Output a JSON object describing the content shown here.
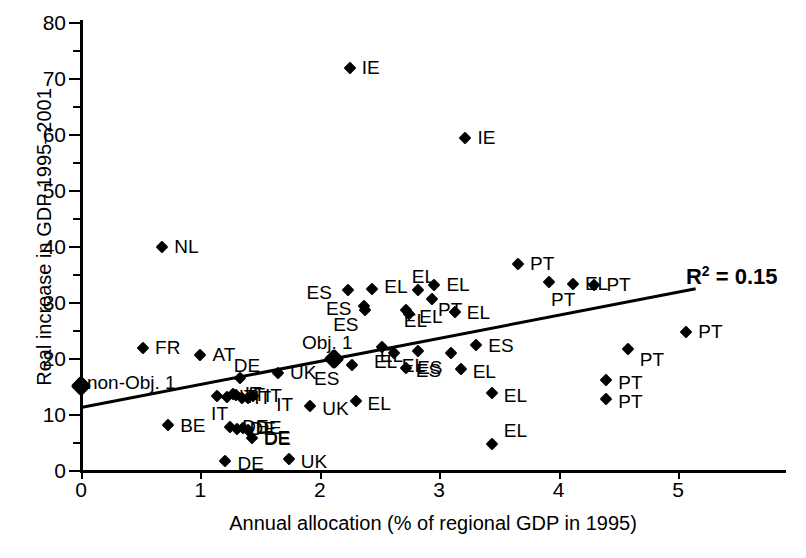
{
  "chart_data": {
    "type": "scatter",
    "title": "",
    "xlabel": "Annual allocation (% of regional GDP in 1995)",
    "ylabel": "Real increase in GDP 1995–2001",
    "xlim": [
      0,
      5.9
    ],
    "ylim": [
      0,
      80
    ],
    "xticks": [
      "0",
      "1",
      "2",
      "3",
      "4",
      "5"
    ],
    "yticks": [
      "0",
      "10",
      "20",
      "30",
      "40",
      "50",
      "60",
      "70",
      "80"
    ],
    "y_minor_ticks": [
      5,
      15,
      25,
      35,
      45,
      55,
      65,
      75
    ],
    "grid": false,
    "legend": "none",
    "annotations": [
      {
        "name": "r_squared",
        "text": "R² = 0.15",
        "value": 0.15,
        "x": 5.15,
        "y": 35.5
      },
      {
        "name": "non-obj-1-label",
        "text": "non-Obj. 1",
        "x": 0.05,
        "y": 15.5
      },
      {
        "name": "obj-1-label",
        "text": "Obj. 1",
        "x": 1.85,
        "y": 22.6
      }
    ],
    "trendline": {
      "x0": 0.0,
      "y0": 11.4,
      "x1": 5.15,
      "y1": 32.6
    },
    "special_markers": [
      {
        "label": "non-Obj. 1",
        "x": 0.0,
        "y": 15.0,
        "size": "big"
      },
      {
        "label": "Obj. 1",
        "x": 2.12,
        "y": 19.9,
        "size": "big"
      }
    ],
    "points": [
      {
        "label": "IE",
        "x": 2.25,
        "y": 71.8
      },
      {
        "label": "IE",
        "x": 3.22,
        "y": 59.3
      },
      {
        "label": "NL",
        "x": 0.68,
        "y": 39.8
      },
      {
        "label": "PT",
        "x": 3.66,
        "y": 36.8
      },
      {
        "label": "PT",
        "x": 3.92,
        "y": 33.5
      },
      {
        "label": "EL",
        "x": 4.12,
        "y": 33.3
      },
      {
        "label": "EL",
        "x": 2.96,
        "y": 33.1
      },
      {
        "label": "PT",
        "x": 4.3,
        "y": 33.0
      },
      {
        "label": "ES",
        "x": 2.24,
        "y": 32.2
      },
      {
        "label": "EL",
        "x": 2.44,
        "y": 32.3
      },
      {
        "label": "EL",
        "x": 2.82,
        "y": 32.2
      },
      {
        "label": "ES",
        "x": 2.37,
        "y": 29.3
      },
      {
        "label": "ES",
        "x": 2.38,
        "y": 28.6
      },
      {
        "label": "PT",
        "x": 2.94,
        "y": 30.5
      },
      {
        "label": "EL",
        "x": 2.72,
        "y": 28.6
      },
      {
        "label": "EL",
        "x": 2.75,
        "y": 27.8
      },
      {
        "label": "EL",
        "x": 3.13,
        "y": 28.3
      },
      {
        "label": "PT",
        "x": 5.07,
        "y": 24.6
      },
      {
        "label": "PT",
        "x": 4.58,
        "y": 21.6
      },
      {
        "label": "FR",
        "x": 0.52,
        "y": 21.7
      },
      {
        "label": "AT",
        "x": 1.0,
        "y": 20.5
      },
      {
        "label": "EL",
        "x": 2.52,
        "y": 22.0
      },
      {
        "label": "ES",
        "x": 3.31,
        "y": 22.3
      },
      {
        "label": "EL",
        "x": 2.62,
        "y": 20.9
      },
      {
        "label": "EL",
        "x": 2.82,
        "y": 21.2
      },
      {
        "label": "ES",
        "x": 3.1,
        "y": 20.9
      },
      {
        "label": "ES",
        "x": 2.27,
        "y": 18.8
      },
      {
        "label": "ES",
        "x": 2.72,
        "y": 18.2
      },
      {
        "label": "EL",
        "x": 3.18,
        "y": 18.1
      },
      {
        "label": "UK",
        "x": 1.65,
        "y": 17.3
      },
      {
        "label": "DE",
        "x": 1.33,
        "y": 16.5
      },
      {
        "label": "PT",
        "x": 4.4,
        "y": 16.0
      },
      {
        "label": "EL",
        "x": 3.44,
        "y": 13.7
      },
      {
        "label": "PT",
        "x": 4.4,
        "y": 12.6
      },
      {
        "label": "UK",
        "x": 1.92,
        "y": 11.5
      },
      {
        "label": "EL",
        "x": 2.3,
        "y": 12.4
      },
      {
        "label": "IT",
        "x": 1.14,
        "y": 13.2
      },
      {
        "label": "IT",
        "x": 1.22,
        "y": 13.0
      },
      {
        "label": "IT",
        "x": 1.27,
        "y": 13.6
      },
      {
        "label": "IT",
        "x": 1.3,
        "y": 13.4
      },
      {
        "label": "IT",
        "x": 1.35,
        "y": 12.8
      },
      {
        "label": "IT",
        "x": 1.4,
        "y": 12.9
      },
      {
        "label": "IT",
        "x": 1.44,
        "y": 13.2
      },
      {
        "label": "BE",
        "x": 0.73,
        "y": 8.1
      },
      {
        "label": "DE",
        "x": 1.25,
        "y": 7.6
      },
      {
        "label": "DE",
        "x": 1.31,
        "y": 7.3
      },
      {
        "label": "DE",
        "x": 1.36,
        "y": 7.5
      },
      {
        "label": "DE",
        "x": 1.4,
        "y": 7.2
      },
      {
        "label": "DE",
        "x": 1.43,
        "y": 5.7
      },
      {
        "label": "DE",
        "x": 1.21,
        "y": 1.6
      },
      {
        "label": "UK",
        "x": 1.74,
        "y": 1.9
      },
      {
        "label": "EL",
        "x": 3.44,
        "y": 4.6
      }
    ],
    "label_offsets": [
      {
        "i": 0,
        "dx": 12,
        "dy": -1
      },
      {
        "i": 1,
        "dx": 12,
        "dy": -1
      },
      {
        "i": 2,
        "dx": 12,
        "dy": -1
      },
      {
        "i": 3,
        "dx": 12,
        "dy": -1
      },
      {
        "i": 4,
        "dx": 2,
        "dy": 17
      },
      {
        "i": 5,
        "dx": 12,
        "dy": -1
      },
      {
        "i": 6,
        "dx": 12,
        "dy": -1
      },
      {
        "i": 7,
        "dx": 12,
        "dy": -1
      },
      {
        "i": 8,
        "dx": -42,
        "dy": 2
      },
      {
        "i": 9,
        "dx": 12,
        "dy": -3
      },
      {
        "i": 10,
        "dx": -6,
        "dy": -14
      },
      {
        "i": 11,
        "dx": -38,
        "dy": 2
      },
      {
        "i": 12,
        "dx": -32,
        "dy": 14
      },
      {
        "i": 13,
        "dx": 6,
        "dy": 10
      },
      {
        "i": 14,
        "dx": -2,
        "dy": 10
      },
      {
        "i": 15,
        "dx": 10,
        "dy": 2
      },
      {
        "i": 16,
        "dx": 12,
        "dy": 0
      },
      {
        "i": 17,
        "dx": 12,
        "dy": -1
      },
      {
        "i": 18,
        "dx": 12,
        "dy": 10
      },
      {
        "i": 19,
        "dx": 12,
        "dy": -1
      },
      {
        "i": 20,
        "dx": 12,
        "dy": -1
      },
      {
        "i": 21,
        "dx": -8,
        "dy": 14
      },
      {
        "i": 22,
        "dx": 12,
        "dy": 0
      },
      {
        "i": 23,
        "dx": 8,
        "dy": 12
      },
      {
        "i": 24,
        "dx": -38,
        "dy": 4
      },
      {
        "i": 25,
        "dx": -34,
        "dy": 14
      },
      {
        "i": 26,
        "dx": -38,
        "dy": 13
      },
      {
        "i": 27,
        "dx": 10,
        "dy": 2
      },
      {
        "i": 28,
        "dx": 12,
        "dy": 2
      },
      {
        "i": 29,
        "dx": 12,
        "dy": -1
      },
      {
        "i": 30,
        "dx": -6,
        "dy": -13
      },
      {
        "i": 31,
        "dx": 12,
        "dy": 2
      },
      {
        "i": 32,
        "dx": 12,
        "dy": 2
      },
      {
        "i": 33,
        "dx": 12,
        "dy": 2
      },
      {
        "i": 34,
        "dx": 12,
        "dy": 2
      },
      {
        "i": 35,
        "dx": 12,
        "dy": 2
      },
      {
        "i": 36,
        "dx": -6,
        "dy": 17
      },
      {
        "i": 41,
        "dx": 28,
        "dy": 6
      },
      {
        "i": 43,
        "dx": 12,
        "dy": 0
      },
      {
        "i": 47,
        "dx": 16,
        "dy": 8
      },
      {
        "i": 49,
        "dx": 12,
        "dy": 2
      },
      {
        "i": 50,
        "dx": 12,
        "dy": 2
      },
      {
        "i": 51,
        "dx": 12,
        "dy": -14
      }
    ]
  },
  "axes_geometry": {
    "origin_x_px": 81,
    "origin_y_px": 470,
    "px_per_x_unit": 119.4,
    "px_per_y_unit": 5.6
  }
}
